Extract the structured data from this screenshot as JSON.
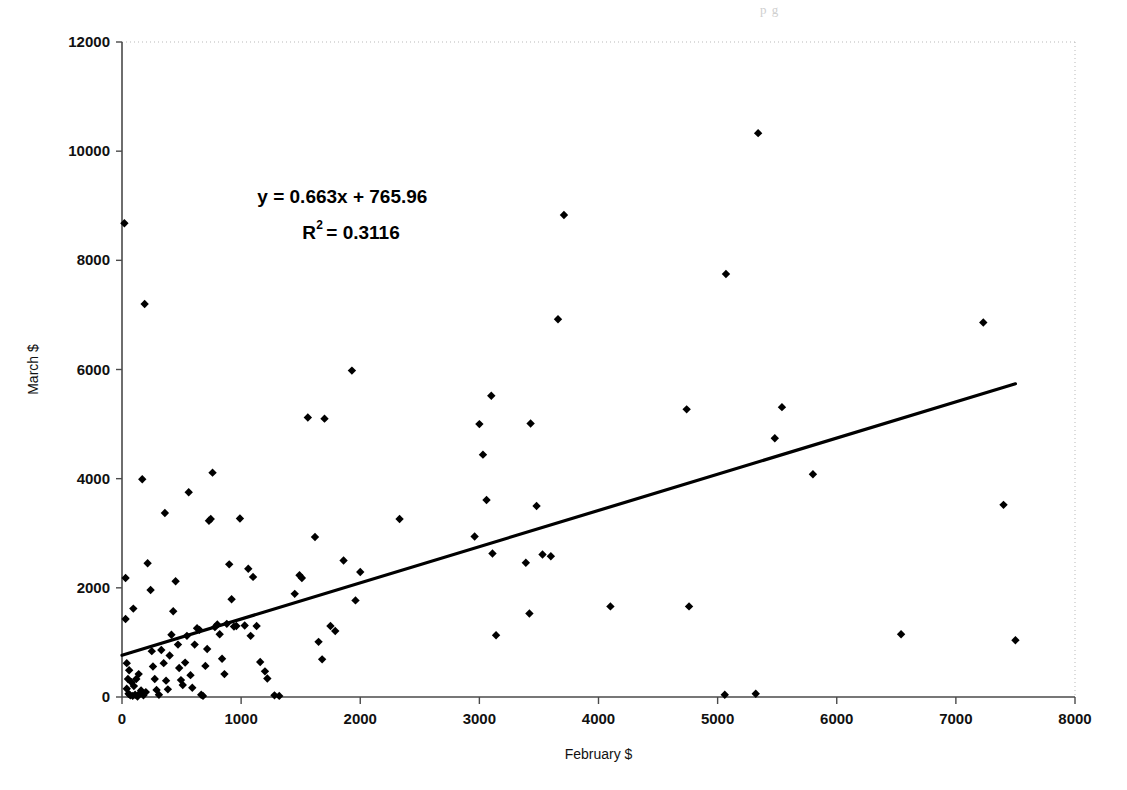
{
  "page": {
    "top_bleed_text": "p          g"
  },
  "chart_data": {
    "type": "scatter",
    "title": "",
    "xlabel": "February $",
    "ylabel": "March $",
    "xlim": [
      0,
      8000
    ],
    "ylim": [
      0,
      12000
    ],
    "xticks": [
      0,
      1000,
      2000,
      3000,
      4000,
      5000,
      6000,
      7000,
      8000
    ],
    "yticks": [
      0,
      2000,
      4000,
      6000,
      8000,
      10000,
      12000
    ],
    "xtick_labels": [
      "0",
      "1000",
      "2000",
      "3000",
      "4000",
      "5000",
      "6000",
      "7000",
      "8000"
    ],
    "ytick_labels": [
      "0",
      "2000",
      "4000",
      "6000",
      "8000",
      "10000",
      "12000"
    ],
    "grid": false,
    "legend": false,
    "marker": "diamond",
    "marker_color": "#000000",
    "annotations": [
      {
        "text": "y = 0.663x + 765.96",
        "x": 1850,
        "y": 9050
      },
      {
        "text": "R2 = 0.3116",
        "display": "R² = 0.3116",
        "x": 1950,
        "y": 8400
      }
    ],
    "trendline": {
      "type": "linear",
      "slope": 0.663,
      "intercept": 765.96,
      "r_squared": 0.3116,
      "equation": "y = 0.663x + 765.96",
      "r2_label": "R² = 0.3116",
      "x_start": 0,
      "x_end": 7500,
      "color": "#000000"
    },
    "points": [
      [
        20,
        8680
      ],
      [
        190,
        7200
      ],
      [
        170,
        3990
      ],
      [
        30,
        2180
      ],
      [
        30,
        1430
      ],
      [
        40,
        620
      ],
      [
        50,
        330
      ],
      [
        40,
        150
      ],
      [
        55,
        60
      ],
      [
        70,
        30
      ],
      [
        90,
        20
      ],
      [
        110,
        40
      ],
      [
        130,
        10
      ],
      [
        150,
        70
      ],
      [
        60,
        490
      ],
      [
        80,
        270
      ],
      [
        100,
        200
      ],
      [
        120,
        330
      ],
      [
        140,
        420
      ],
      [
        160,
        120
      ],
      [
        180,
        30
      ],
      [
        200,
        90
      ],
      [
        95,
        1620
      ],
      [
        215,
        2450
      ],
      [
        240,
        1960
      ],
      [
        250,
        840
      ],
      [
        260,
        560
      ],
      [
        275,
        330
      ],
      [
        290,
        130
      ],
      [
        310,
        40
      ],
      [
        330,
        860
      ],
      [
        350,
        620
      ],
      [
        360,
        3370
      ],
      [
        370,
        300
      ],
      [
        385,
        140
      ],
      [
        400,
        760
      ],
      [
        415,
        1140
      ],
      [
        430,
        1570
      ],
      [
        450,
        2120
      ],
      [
        470,
        960
      ],
      [
        480,
        530
      ],
      [
        495,
        310
      ],
      [
        510,
        220
      ],
      [
        530,
        630
      ],
      [
        545,
        1120
      ],
      [
        560,
        3750
      ],
      [
        575,
        400
      ],
      [
        590,
        170
      ],
      [
        610,
        960
      ],
      [
        630,
        1260
      ],
      [
        650,
        1230
      ],
      [
        665,
        40
      ],
      [
        680,
        20
      ],
      [
        700,
        570
      ],
      [
        715,
        880
      ],
      [
        730,
        3230
      ],
      [
        745,
        3260
      ],
      [
        760,
        4110
      ],
      [
        780,
        1280
      ],
      [
        800,
        1330
      ],
      [
        820,
        1150
      ],
      [
        840,
        700
      ],
      [
        860,
        420
      ],
      [
        880,
        1340
      ],
      [
        900,
        2430
      ],
      [
        920,
        1790
      ],
      [
        940,
        1290
      ],
      [
        960,
        1300
      ],
      [
        990,
        3270
      ],
      [
        1030,
        1310
      ],
      [
        1060,
        2350
      ],
      [
        1080,
        1120
      ],
      [
        1100,
        2200
      ],
      [
        1130,
        1300
      ],
      [
        1160,
        640
      ],
      [
        1200,
        470
      ],
      [
        1220,
        340
      ],
      [
        1280,
        30
      ],
      [
        1320,
        20
      ],
      [
        1450,
        1890
      ],
      [
        1490,
        2230
      ],
      [
        1510,
        2180
      ],
      [
        1560,
        5120
      ],
      [
        1620,
        2930
      ],
      [
        1650,
        1010
      ],
      [
        1680,
        690
      ],
      [
        1700,
        5100
      ],
      [
        1750,
        1300
      ],
      [
        1790,
        1210
      ],
      [
        1860,
        2500
      ],
      [
        1930,
        5980
      ],
      [
        1960,
        1770
      ],
      [
        2000,
        2290
      ],
      [
        2330,
        3260
      ],
      [
        2960,
        2940
      ],
      [
        3000,
        5000
      ],
      [
        3030,
        4440
      ],
      [
        3060,
        3610
      ],
      [
        3100,
        5520
      ],
      [
        3110,
        2630
      ],
      [
        3140,
        1130
      ],
      [
        3390,
        2460
      ],
      [
        3420,
        1530
      ],
      [
        3430,
        5010
      ],
      [
        3480,
        3500
      ],
      [
        3530,
        2610
      ],
      [
        3600,
        2580
      ],
      [
        3660,
        6920
      ],
      [
        3710,
        8830
      ],
      [
        4100,
        1660
      ],
      [
        4740,
        5270
      ],
      [
        4760,
        1660
      ],
      [
        5060,
        40
      ],
      [
        5070,
        7750
      ],
      [
        5320,
        60
      ],
      [
        5340,
        10330
      ],
      [
        5480,
        4740
      ],
      [
        5540,
        5310
      ],
      [
        5800,
        4080
      ],
      [
        6540,
        1150
      ],
      [
        7230,
        6860
      ],
      [
        7400,
        3520
      ],
      [
        7500,
        1040
      ]
    ]
  }
}
